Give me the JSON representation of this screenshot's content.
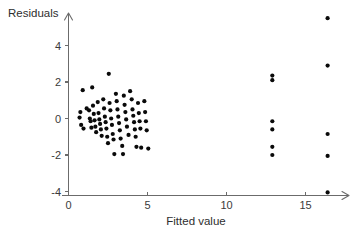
{
  "chart_data": {
    "type": "scatter",
    "title": "",
    "subtitle": "",
    "xlabel": "Fitted value",
    "ylabel": "Residuals",
    "xlim": [
      -0.6,
      18.2
    ],
    "ylim": [
      -4.9,
      6.2
    ],
    "xticks": [
      0,
      5,
      10,
      15
    ],
    "xtick_labels": [
      "0",
      "5",
      "10",
      "15"
    ],
    "yticks": [
      -4,
      -2,
      0,
      2,
      4
    ],
    "ytick_labels": [
      "-4",
      "-2",
      "0",
      "2",
      "4"
    ],
    "grid": false,
    "legend": null,
    "point_color": "#0a0a0a",
    "axis_color": "#6b6b6b",
    "marker": "filled-circle",
    "marker_size": 2.1,
    "points": [
      [
        0.9,
        1.55
      ],
      [
        0.75,
        0.35
      ],
      [
        0.7,
        0.05
      ],
      [
        0.8,
        -0.35
      ],
      [
        0.95,
        -0.55
      ],
      [
        1.15,
        0.55
      ],
      [
        1.3,
        0.45
      ],
      [
        1.35,
        0.0
      ],
      [
        1.4,
        -0.15
      ],
      [
        1.45,
        -0.5
      ],
      [
        1.5,
        1.7
      ],
      [
        1.55,
        0.7
      ],
      [
        1.6,
        0.25
      ],
      [
        1.65,
        -0.1
      ],
      [
        1.7,
        -0.45
      ],
      [
        1.75,
        -0.75
      ],
      [
        1.85,
        0.9
      ],
      [
        1.9,
        0.3
      ],
      [
        1.95,
        -0.05
      ],
      [
        2.0,
        -0.3
      ],
      [
        2.05,
        -0.6
      ],
      [
        2.1,
        -0.95
      ],
      [
        2.2,
        1.05
      ],
      [
        2.25,
        0.55
      ],
      [
        2.3,
        0.1
      ],
      [
        2.35,
        -0.2
      ],
      [
        2.4,
        -0.55
      ],
      [
        2.45,
        -1.0
      ],
      [
        2.5,
        -1.35
      ],
      [
        2.55,
        2.45
      ],
      [
        2.6,
        0.85
      ],
      [
        2.65,
        0.45
      ],
      [
        2.7,
        0.0
      ],
      [
        2.75,
        -0.35
      ],
      [
        2.8,
        -0.85
      ],
      [
        2.85,
        -1.15
      ],
      [
        2.9,
        -1.95
      ],
      [
        3.0,
        1.35
      ],
      [
        3.05,
        0.95
      ],
      [
        3.1,
        0.5
      ],
      [
        3.15,
        0.1
      ],
      [
        3.2,
        -0.25
      ],
      [
        3.25,
        -0.65
      ],
      [
        3.3,
        -1.1
      ],
      [
        3.4,
        -1.5
      ],
      [
        3.45,
        -1.95
      ],
      [
        3.5,
        1.25
      ],
      [
        3.55,
        0.75
      ],
      [
        3.6,
        0.35
      ],
      [
        3.65,
        -0.05
      ],
      [
        3.7,
        -0.45
      ],
      [
        3.8,
        -0.9
      ],
      [
        3.9,
        1.5
      ],
      [
        4.0,
        1.05
      ],
      [
        4.05,
        0.5
      ],
      [
        4.1,
        0.15
      ],
      [
        4.15,
        -0.2
      ],
      [
        4.2,
        -0.6
      ],
      [
        4.25,
        -1.0
      ],
      [
        4.3,
        -1.55
      ],
      [
        4.4,
        0.85
      ],
      [
        4.45,
        0.3
      ],
      [
        4.5,
        -0.15
      ],
      [
        4.55,
        -0.55
      ],
      [
        4.6,
        -1.6
      ],
      [
        4.8,
        0.95
      ],
      [
        4.85,
        0.35
      ],
      [
        4.9,
        -0.15
      ],
      [
        4.95,
        -0.65
      ],
      [
        5.05,
        -1.65
      ],
      [
        12.9,
        2.35
      ],
      [
        12.9,
        2.1
      ],
      [
        12.9,
        -0.15
      ],
      [
        12.9,
        -0.6
      ],
      [
        12.9,
        -1.55
      ],
      [
        12.9,
        -2.0
      ],
      [
        16.4,
        5.5
      ],
      [
        16.4,
        2.9
      ],
      [
        16.4,
        -0.85
      ],
      [
        16.4,
        -2.05
      ],
      [
        16.4,
        -4.05
      ]
    ]
  },
  "axes": {
    "y_title": "Residuals",
    "x_title": "Fitted value"
  }
}
